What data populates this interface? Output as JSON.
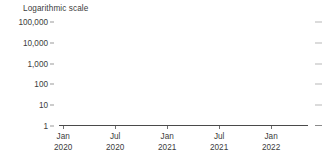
{
  "chart_data": {
    "type": "bar",
    "title": "Logarithmic scale",
    "xlabel": "",
    "ylabel": "",
    "scale": "log10",
    "grid": false,
    "legend": null,
    "ylim": [
      1,
      100000
    ],
    "y_ticks": [
      {
        "value": 100000,
        "label": "100,000"
      },
      {
        "value": 10000,
        "label": "10,000"
      },
      {
        "value": 1000,
        "label": "1,000"
      },
      {
        "value": 100,
        "label": "100"
      },
      {
        "value": 10,
        "label": "10"
      },
      {
        "value": 1,
        "label": "1"
      }
    ],
    "x_ticks": [
      {
        "position": 0.0167,
        "line1": "Jan",
        "line2": "2020"
      },
      {
        "position": 0.2255,
        "line1": "Jul",
        "line2": "2020"
      },
      {
        "position": 0.4343,
        "line1": "Jan",
        "line2": "2021"
      },
      {
        "position": 0.6431,
        "line1": "Jul",
        "line2": "2021"
      },
      {
        "position": 0.8519,
        "line1": "Jan",
        "line2": "2022"
      }
    ],
    "bar_color": "#e3e3e3",
    "axis_color": "#4a4a4a",
    "text_color": "#3c3c3c",
    "x_start": "2020-01",
    "x_end": "2022-03",
    "values": [
      2,
      3,
      5,
      9,
      14,
      26,
      40,
      70,
      120,
      260,
      480,
      900,
      1600,
      2700,
      3900,
      5600,
      7400,
      9200,
      11000,
      13500,
      15800,
      19800,
      17500,
      14200,
      11800,
      9800,
      8200,
      6800,
      5400,
      4300,
      3600,
      2900,
      2400,
      2000,
      1700,
      1450,
      1200,
      1050,
      900,
      780,
      650,
      560,
      470,
      400,
      340,
      300,
      265,
      235,
      210,
      190,
      175,
      160,
      148,
      140,
      250,
      190,
      130,
      120,
      115,
      110,
      260,
      200,
      150,
      120,
      105,
      95,
      90,
      210,
      160,
      130,
      100,
      88,
      80,
      75,
      180,
      150,
      120,
      95,
      82,
      74,
      68,
      160,
      135,
      110,
      90,
      78,
      70,
      64,
      150,
      128,
      105,
      86,
      74,
      66,
      60,
      145,
      120,
      100,
      82,
      70,
      62,
      58,
      140,
      118,
      98,
      80,
      68,
      60,
      55,
      360,
      150,
      110,
      88,
      72,
      63,
      57,
      230,
      135,
      105,
      85,
      70,
      61,
      55,
      200,
      130,
      100,
      82,
      68,
      60,
      54,
      190,
      125,
      98,
      80,
      66,
      58,
      52,
      180,
      120,
      95,
      78,
      64,
      56,
      50,
      175,
      118,
      92,
      76,
      63,
      55,
      49,
      170,
      115,
      90,
      74,
      62,
      54,
      48,
      520,
      210,
      130,
      95,
      76,
      64,
      56,
      300,
      160,
      110,
      88,
      72,
      60,
      53,
      250,
      145,
      105,
      84,
      70,
      58,
      52,
      230,
      140,
      102,
      82,
      68,
      57,
      51,
      210,
      135,
      100,
      80,
      66,
      56,
      50,
      200,
      130,
      98,
      78,
      65,
      55,
      49,
      195,
      128,
      96,
      77,
      64,
      54,
      48,
      190,
      125,
      95,
      76,
      63,
      53,
      47,
      240,
      150,
      110,
      85,
      70,
      58,
      51,
      280,
      170,
      120,
      92,
      74,
      61,
      53,
      320,
      190,
      130,
      98,
      78,
      64,
      55,
      400,
      230,
      150,
      110,
      86,
      70,
      59,
      480,
      270,
      170,
      122,
      94,
      75,
      62,
      560,
      310,
      190,
      135,
      102,
      81,
      66,
      640,
      350,
      210,
      148,
      110,
      86,
      70,
      1150,
      420,
      240,
      165,
      120,
      93,
      75,
      3900,
      560,
      300,
      200,
      142,
      106,
      84,
      820,
      430,
      250,
      172,
      126,
      96,
      77,
      700,
      380,
      225,
      158,
      117,
      90,
      73,
      760,
      400,
      235,
      164,
      121,
      92,
      74,
      820,
      430,
      250,
      174,
      127,
      97,
      78,
      880,
      460,
      265,
      183,
      133,
      101,
      81,
      940,
      490,
      282,
      193,
      140,
      106,
      84,
      1000,
      520,
      298,
      203,
      147,
      110,
      87,
      1100,
      560,
      318,
      216,
      155,
      116,
      91,
      1250,
      620,
      350,
      235,
      168,
      125,
      97,
      1400,
      690,
      385,
      256,
      182,
      134,
      103,
      1600,
      780,
      430,
      284,
      200,
      146,
      111,
      1850,
      890,
      485,
      318,
      222,
      161,
      122,
      2150,
      1020,
      550,
      358,
      248,
      178,
      134,
      2500,
      1180,
      630,
      405,
      279,
      199,
      148,
      2900,
      1360,
      720,
      460,
      314,
      222,
      164,
      3400,
      1580,
      830,
      525,
      355,
      249,
      182,
      4100,
      1880,
      975,
      610,
      410,
      285,
      206,
      4900,
      2230,
      1140,
      710,
      472,
      326,
      234,
      3200,
      1500,
      800,
      510,
      345,
      242,
      177
    ]
  }
}
